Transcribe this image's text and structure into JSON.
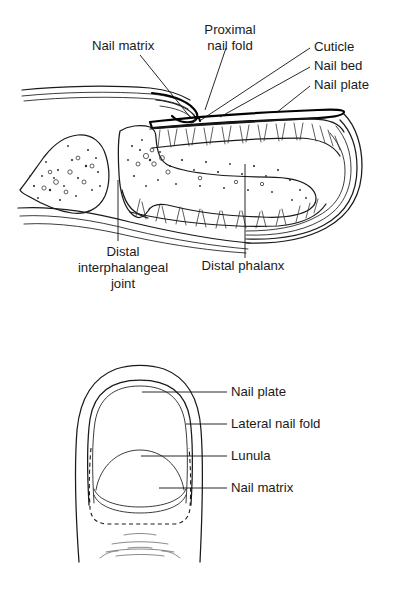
{
  "figure": {
    "background_color": "#ffffff",
    "ink_color": "#1a1a1a",
    "panels": [
      {
        "id": "sagittal-section",
        "name": "Sagittal section of distal finger and nail unit",
        "labels": [
          {
            "key": "nail-matrix",
            "text": "Nail matrix",
            "lines": [
              "Nail matrix"
            ],
            "align": "left",
            "x": 92,
            "y": 50
          },
          {
            "key": "proximal-nail-fold",
            "text": "Proximal nail fold",
            "lines": [
              "Proximal",
              "nail fold"
            ],
            "align": "center",
            "x": 230,
            "y": 34
          },
          {
            "key": "cuticle",
            "text": "Cuticle",
            "lines": [
              "Cuticle"
            ],
            "align": "left",
            "x": 314,
            "y": 51
          },
          {
            "key": "nail-bed",
            "text": "Nail bed",
            "lines": [
              "Nail bed"
            ],
            "align": "left",
            "x": 314,
            "y": 70
          },
          {
            "key": "nail-plate",
            "text": "Nail plate",
            "lines": [
              "Nail plate"
            ],
            "align": "left",
            "x": 314,
            "y": 89
          },
          {
            "key": "distal-interphalangeal-joint",
            "text": "Distal interphalangeal joint",
            "lines": [
              "Distal",
              "interphalangeal",
              "joint"
            ],
            "align": "center",
            "x": 123,
            "y": 256
          },
          {
            "key": "distal-phalanx",
            "text": "Distal phalanx",
            "lines": [
              "Distal phalanx"
            ],
            "align": "center",
            "x": 243,
            "y": 270
          }
        ]
      },
      {
        "id": "dorsal-view",
        "name": "Dorsal view of fingertip and nail",
        "labels": [
          {
            "key": "nail-plate",
            "text": "Nail plate",
            "lines": [
              "Nail plate"
            ],
            "align": "left",
            "x": 231,
            "y": 396
          },
          {
            "key": "lateral-nail-fold",
            "text": "Lateral nail fold",
            "lines": [
              "Lateral nail fold"
            ],
            "align": "left",
            "x": 231,
            "y": 428
          },
          {
            "key": "lunula",
            "text": "Lunula",
            "lines": [
              "Lunula"
            ],
            "align": "left",
            "x": 231,
            "y": 460
          },
          {
            "key": "nail-matrix",
            "text": "Nail matrix",
            "lines": [
              "Nail matrix"
            ],
            "align": "left",
            "x": 231,
            "y": 492
          }
        ]
      }
    ]
  }
}
